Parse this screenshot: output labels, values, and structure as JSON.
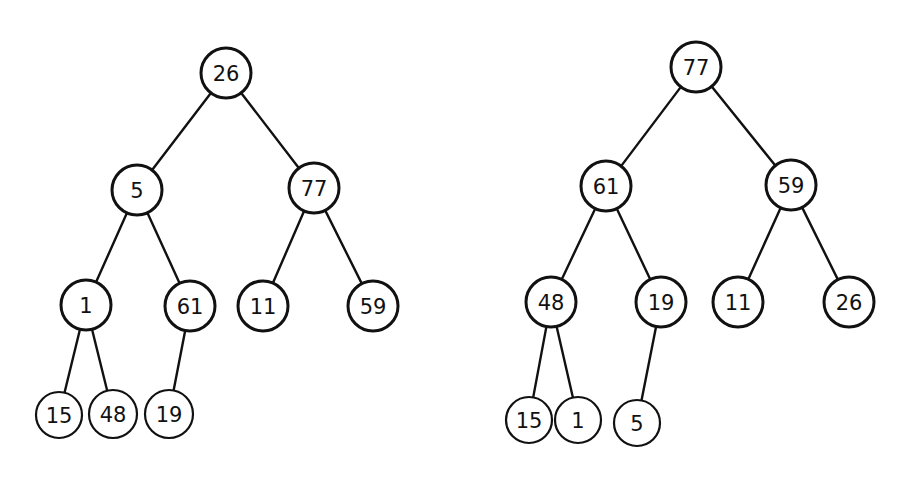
{
  "diagram": {
    "type": "binary-trees",
    "trees": [
      {
        "name": "left-tree",
        "nodes": [
          {
            "id": "L0",
            "label": "26",
            "x": 226,
            "y": 73,
            "r": 25
          },
          {
            "id": "L1",
            "label": "5",
            "x": 137,
            "y": 190,
            "r": 25
          },
          {
            "id": "L2",
            "label": "77",
            "x": 314,
            "y": 188,
            "r": 25
          },
          {
            "id": "L3",
            "label": "1",
            "x": 86,
            "y": 305,
            "r": 25
          },
          {
            "id": "L4",
            "label": "61",
            "x": 190,
            "y": 306,
            "r": 25
          },
          {
            "id": "L5",
            "label": "11",
            "x": 263,
            "y": 306,
            "r": 25
          },
          {
            "id": "L6",
            "label": "59",
            "x": 373,
            "y": 306,
            "r": 25
          },
          {
            "id": "L7",
            "label": "15",
            "x": 59,
            "y": 415,
            "r": 23
          },
          {
            "id": "L8",
            "label": "48",
            "x": 113,
            "y": 414,
            "r": 24
          },
          {
            "id": "L9",
            "label": "19",
            "x": 169,
            "y": 414,
            "r": 24
          }
        ],
        "edges": [
          [
            "L0",
            "L1"
          ],
          [
            "L0",
            "L2"
          ],
          [
            "L1",
            "L3"
          ],
          [
            "L1",
            "L4"
          ],
          [
            "L2",
            "L5"
          ],
          [
            "L2",
            "L6"
          ],
          [
            "L3",
            "L7"
          ],
          [
            "L3",
            "L8"
          ],
          [
            "L4",
            "L9"
          ]
        ]
      },
      {
        "name": "right-tree",
        "nodes": [
          {
            "id": "R0",
            "label": "77",
            "x": 696,
            "y": 67,
            "r": 25
          },
          {
            "id": "R1",
            "label": "61",
            "x": 606,
            "y": 186,
            "r": 25
          },
          {
            "id": "R2",
            "label": "59",
            "x": 791,
            "y": 185,
            "r": 25
          },
          {
            "id": "R3",
            "label": "48",
            "x": 551,
            "y": 302,
            "r": 25
          },
          {
            "id": "R4",
            "label": "19",
            "x": 661,
            "y": 302,
            "r": 25
          },
          {
            "id": "R5",
            "label": "11",
            "x": 738,
            "y": 302,
            "r": 25
          },
          {
            "id": "R6",
            "label": "26",
            "x": 849,
            "y": 302,
            "r": 25
          },
          {
            "id": "R7",
            "label": "15",
            "x": 529,
            "y": 420,
            "r": 23
          },
          {
            "id": "R8",
            "label": "1",
            "x": 578,
            "y": 420,
            "r": 23
          },
          {
            "id": "R9",
            "label": "5",
            "x": 637,
            "y": 423,
            "r": 23
          }
        ],
        "edges": [
          [
            "R0",
            "R1"
          ],
          [
            "R0",
            "R2"
          ],
          [
            "R1",
            "R3"
          ],
          [
            "R1",
            "R4"
          ],
          [
            "R2",
            "R5"
          ],
          [
            "R2",
            "R6"
          ],
          [
            "R3",
            "R7"
          ],
          [
            "R3",
            "R8"
          ],
          [
            "R4",
            "R9"
          ]
        ]
      }
    ]
  }
}
